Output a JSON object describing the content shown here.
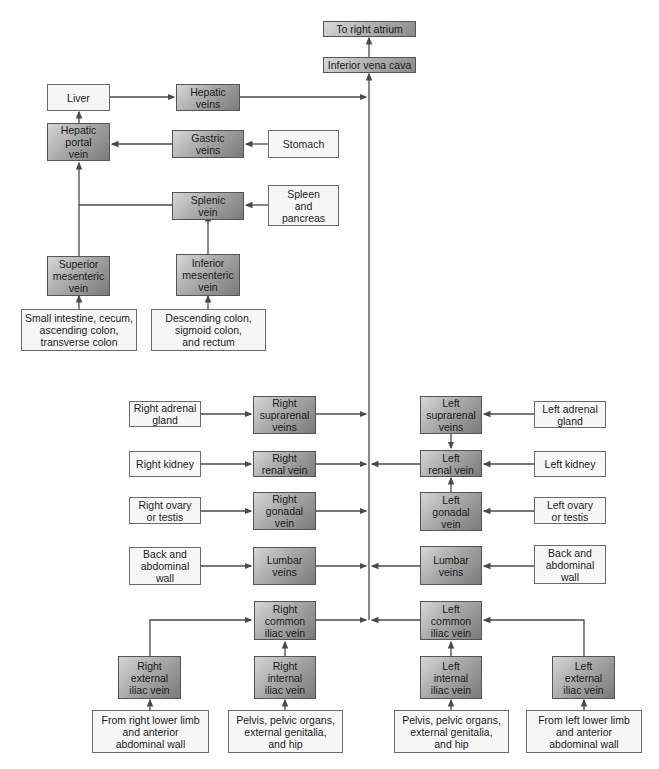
{
  "diagram": {
    "nodes": {
      "to_right_atrium": "To right atrium",
      "inferior_vena_cava": "Inferior vena cava",
      "liver": "Liver",
      "hepatic_veins": "Hepatic\nveins",
      "hepatic_portal_vein": "Hepatic\nportal\nvein",
      "gastric_veins": "Gastric\nveins",
      "stomach": "Stomach",
      "splenic_vein": "Splenic\nvein",
      "spleen_pancreas": "Spleen\nand\npancreas",
      "superior_mesenteric_vein": "Superior\nmesenteric\nvein",
      "inferior_mesenteric_vein": "Inferior\nmesenteric\nvein",
      "small_intestine": "Small intestine, cecum,\nascending colon,\ntransverse colon",
      "descending_colon": "Descending colon,\nsigmoid colon,\nand rectum",
      "right_adrenal_gland": "Right adrenal\ngland",
      "right_suprarenal_veins": "Right\nsuprarenal\nveins",
      "right_kidney": "Right kidney",
      "right_renal_vein": "Right\nrenal vein",
      "right_ovary_testis": "Right ovary\nor testis",
      "right_gonadal_vein": "Right\ngonadal\nvein",
      "right_back_wall": "Back and\nabdominal\nwall",
      "right_lumbar_veins": "Lumbar\nveins",
      "right_common_iliac": "Right\ncommon\niliac vein",
      "right_external_iliac": "Right\nexternal\niliac vein",
      "right_internal_iliac": "Right\ninternal\niliac vein",
      "right_lower_limb": "From right lower limb\nand anterior\nabdominal wall",
      "right_pelvis": "Pelvis, pelvic organs,\nexternal genitalia,\nand hip",
      "left_suprarenal_veins": "Left\nsuprarenal\nveins",
      "left_adrenal_gland": "Left adrenal\ngland",
      "left_renal_vein": "Left\nrenal vein",
      "left_kidney": "Left kidney",
      "left_gonadal_vein": "Left\ngonadal\nvein",
      "left_ovary_testis": "Left ovary\nor testis",
      "left_lumbar_veins": "Lumbar\nveins",
      "left_back_wall": "Back and\nabdominal\nwall",
      "left_common_iliac": "Left\ncommon\niliac vein",
      "left_internal_iliac": "Left\ninternal\niliac vein",
      "left_external_iliac": "Left\nexternal\niliac vein",
      "left_pelvis": "Pelvis, pelvic organs,\nexternal genitalia,\nand hip",
      "left_lower_limb": "From left lower limb\nand anterior\nabdominal wall"
    },
    "colors": {
      "line": "#4a4a4a",
      "vein_box_dark": "#7a7a7a",
      "vein_box_light": "#d6d6d6",
      "source_box": "#f7f7f7"
    }
  }
}
